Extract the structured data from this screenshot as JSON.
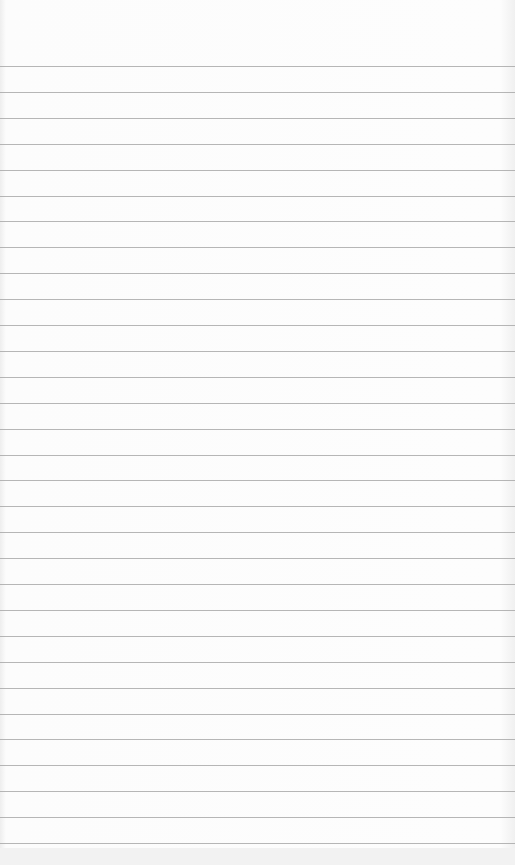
{
  "paper": {
    "description": "blank lined notepad page",
    "line_color": "#a9a9a9",
    "background": "#fbfbfb",
    "first_line_y": 66,
    "line_spacing": 25.9,
    "line_count": 31
  }
}
